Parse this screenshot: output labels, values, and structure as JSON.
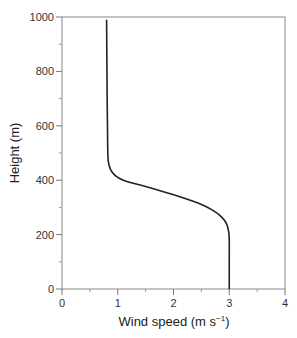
{
  "chart_data": {
    "type": "line",
    "title": "",
    "xlabel": "Wind speed (m s⁻¹)",
    "xlabel_main": "Wind speed (m s",
    "xlabel_sup": "−1",
    "xlabel_end": ")",
    "ylabel": "Height (m)",
    "xlim": [
      0,
      4
    ],
    "ylim": [
      0,
      1000
    ],
    "x_ticks": [
      0,
      1,
      2,
      3,
      4
    ],
    "x_tick_labels": [
      "0",
      "1",
      "2",
      "3",
      "4"
    ],
    "x_minor_ticks": [
      0.5,
      1.5,
      2.5,
      3.5
    ],
    "y_ticks": [
      0,
      200,
      400,
      600,
      800,
      1000
    ],
    "y_tick_labels": [
      "0",
      "200",
      "400",
      "600",
      "800",
      "1000"
    ],
    "y_minor_ticks": [
      100,
      300,
      500,
      700,
      900
    ],
    "grid": false,
    "legend": null,
    "series": [
      {
        "name": "Wind speed profile",
        "color": "#222222",
        "points": [
          {
            "x": 3.0,
            "y": 0
          },
          {
            "x": 3.0,
            "y": 100
          },
          {
            "x": 3.0,
            "y": 180
          },
          {
            "x": 2.99,
            "y": 210
          },
          {
            "x": 2.95,
            "y": 240
          },
          {
            "x": 2.86,
            "y": 265
          },
          {
            "x": 2.7,
            "y": 290
          },
          {
            "x": 2.45,
            "y": 315
          },
          {
            "x": 2.1,
            "y": 340
          },
          {
            "x": 1.7,
            "y": 365
          },
          {
            "x": 1.35,
            "y": 385
          },
          {
            "x": 1.1,
            "y": 400
          },
          {
            "x": 0.95,
            "y": 418
          },
          {
            "x": 0.87,
            "y": 440
          },
          {
            "x": 0.83,
            "y": 470
          },
          {
            "x": 0.82,
            "y": 520
          },
          {
            "x": 0.81,
            "y": 700
          },
          {
            "x": 0.8,
            "y": 990
          }
        ]
      }
    ]
  },
  "plot_area": {
    "left": 62,
    "top": 17,
    "right": 285,
    "bottom": 289
  }
}
